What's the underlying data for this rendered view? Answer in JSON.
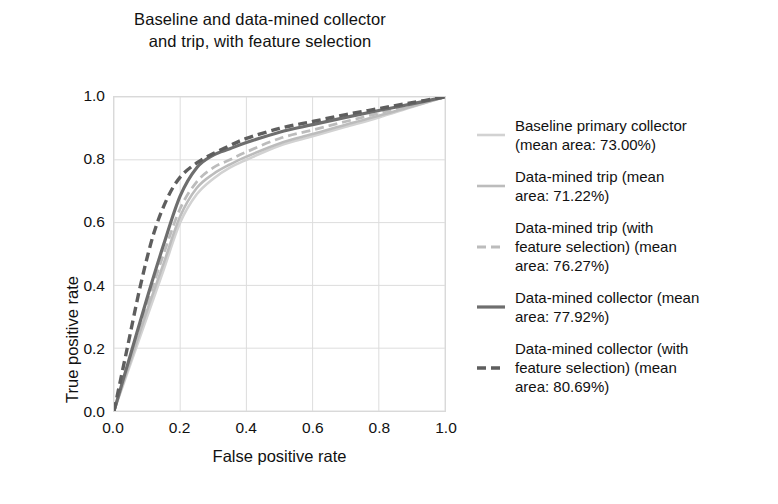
{
  "chart_data": {
    "type": "line",
    "title": "Baseline and data-mined collector and trip, with feature selection",
    "title_lines": [
      "Baseline and data-mined collector",
      "and trip, with feature selection"
    ],
    "xlabel": "False positive rate",
    "ylabel": "True positive rate",
    "xlim": [
      0.0,
      1.0
    ],
    "ylim": [
      0.0,
      1.0
    ],
    "xticks": [
      "0.0",
      "0.2",
      "0.4",
      "0.6",
      "0.8",
      "1.0"
    ],
    "yticks": [
      "0.0",
      "0.2",
      "0.4",
      "0.6",
      "0.8",
      "1.0"
    ],
    "xtick_values": [
      0.0,
      0.2,
      0.4,
      0.6,
      0.8,
      1.0
    ],
    "ytick_values": [
      0.0,
      0.2,
      0.4,
      0.6,
      0.8,
      1.0
    ],
    "grid": true,
    "grid_color": "#dddddd",
    "legend_position": "right",
    "series": [
      {
        "name": "Baseline primary collector (mean area: 73.00%)",
        "label_lines": [
          "Baseline primary collector",
          "(mean area: 73.00%)"
        ],
        "mean_area": "73.00%",
        "color": "#d2d2d2",
        "width": 2.6,
        "dash": "solid",
        "x": [
          0.0,
          0.05,
          0.1,
          0.15,
          0.2,
          0.25,
          0.3,
          0.35,
          0.4,
          0.5,
          0.6,
          0.7,
          0.8,
          0.9,
          1.0
        ],
        "y": [
          0.0,
          0.15,
          0.3,
          0.45,
          0.6,
          0.69,
          0.74,
          0.775,
          0.8,
          0.845,
          0.875,
          0.905,
          0.935,
          0.968,
          1.0
        ]
      },
      {
        "name": "Data-mined trip (mean area: 71.22%)",
        "label_lines": [
          "Data-mined trip (mean",
          "area: 71.22%)"
        ],
        "mean_area": "71.22%",
        "color": "#bcbcbc",
        "width": 2.6,
        "dash": "solid",
        "x": [
          0.0,
          0.05,
          0.1,
          0.15,
          0.2,
          0.25,
          0.3,
          0.35,
          0.4,
          0.5,
          0.6,
          0.7,
          0.8,
          0.9,
          1.0
        ],
        "y": [
          0.0,
          0.16,
          0.32,
          0.47,
          0.62,
          0.71,
          0.755,
          0.785,
          0.81,
          0.852,
          0.882,
          0.912,
          0.94,
          0.97,
          1.0
        ]
      },
      {
        "name": "Data-mined trip (with feature selection) (mean area: 76.27%)",
        "label_lines": [
          "Data-mined trip (with",
          "feature selection) (mean",
          "area: 76.27%)"
        ],
        "mean_area": "76.27%",
        "color": "#bcbcbc",
        "width": 2.8,
        "dash": "dashed",
        "x": [
          0.0,
          0.05,
          0.1,
          0.15,
          0.2,
          0.25,
          0.3,
          0.35,
          0.4,
          0.5,
          0.6,
          0.7,
          0.8,
          0.9,
          1.0
        ],
        "y": [
          0.0,
          0.17,
          0.34,
          0.5,
          0.645,
          0.73,
          0.775,
          0.8,
          0.825,
          0.868,
          0.895,
          0.922,
          0.948,
          0.974,
          1.0
        ]
      },
      {
        "name": "Data-mined collector (mean area: 77.92%)",
        "label_lines": [
          "Data-mined collector (mean",
          "area: 77.92%)"
        ],
        "mean_area": "77.92%",
        "color": "#6e6e6e",
        "width": 3.2,
        "dash": "solid",
        "x": [
          0.0,
          0.05,
          0.1,
          0.15,
          0.2,
          0.25,
          0.3,
          0.35,
          0.4,
          0.5,
          0.6,
          0.7,
          0.8,
          0.9,
          1.0
        ],
        "y": [
          0.0,
          0.18,
          0.36,
          0.53,
          0.685,
          0.775,
          0.815,
          0.835,
          0.855,
          0.888,
          0.912,
          0.935,
          0.957,
          0.978,
          1.0
        ]
      },
      {
        "name": "Data-mined collector (with feature selection) (mean area: 80.69%)",
        "label_lines": [
          "Data-mined collector (with",
          "feature selection) (mean",
          "area: 80.69%)"
        ],
        "mean_area": "80.69%",
        "color": "#5e5e5e",
        "width": 3.4,
        "dash": "dashed",
        "x": [
          0.0,
          0.04,
          0.08,
          0.12,
          0.16,
          0.2,
          0.25,
          0.3,
          0.35,
          0.4,
          0.5,
          0.6,
          0.7,
          0.8,
          0.9,
          1.0
        ],
        "y": [
          0.0,
          0.2,
          0.4,
          0.565,
          0.675,
          0.745,
          0.79,
          0.82,
          0.845,
          0.868,
          0.9,
          0.922,
          0.944,
          0.963,
          0.982,
          1.0
        ]
      }
    ]
  }
}
